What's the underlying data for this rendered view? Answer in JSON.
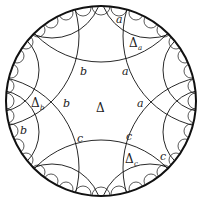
{
  "diagram": {
    "type": "poincare-disk-hyperbolic-tiling",
    "disk": {
      "cx": 101,
      "cy": 101,
      "r": 95,
      "stroke": "#111111"
    },
    "central_tile_label": "Δ",
    "labels": [
      {
        "text": "a",
        "x": 116,
        "y": 23
      },
      {
        "text": "a",
        "x": 122,
        "y": 75
      },
      {
        "text": "a",
        "x": 137,
        "y": 107
      },
      {
        "text": "b",
        "x": 80,
        "y": 75
      },
      {
        "text": "b",
        "x": 63,
        "y": 107
      },
      {
        "text": "b",
        "x": 20,
        "y": 134
      },
      {
        "text": "c",
        "x": 77,
        "y": 142
      },
      {
        "text": "c",
        "x": 126,
        "y": 140
      },
      {
        "text": "c",
        "x": 160,
        "y": 160
      }
    ],
    "triangle_labels": [
      {
        "main": "Δ",
        "sub": "a",
        "x": 129,
        "y": 47
      },
      {
        "main": "Δ",
        "sub": "b",
        "x": 31,
        "y": 107
      },
      {
        "main": "Δ",
        "sub": "c",
        "x": 125,
        "y": 163
      }
    ]
  }
}
